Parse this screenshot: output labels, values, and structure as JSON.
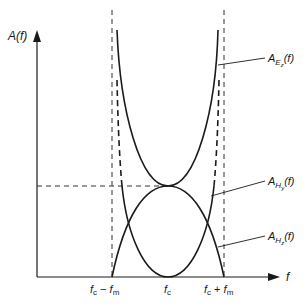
{
  "diagram": {
    "y_axis_label": "A(f)",
    "x_axis_label": "f",
    "x_ticks": [
      "fᴄ − fₘ",
      "fᴄ",
      "fᴄ + fₘ"
    ],
    "x_tick_labels": {
      "left": {
        "base": "f",
        "sub": "c",
        "op": " − ",
        "base2": "f",
        "sub2": "m"
      },
      "center": {
        "base": "f",
        "sub": "c"
      },
      "right": {
        "base": "f",
        "sub": "c",
        "op": " + ",
        "base2": "f",
        "sub2": "m"
      }
    },
    "curves": [
      {
        "name": "A_Ez(f)",
        "label_base": "A",
        "label_sub": "E",
        "label_subsub": "z",
        "label_tail": "(f)",
        "shape": "U-shaped, diverging at f_c ± f_m, minimum at f_c"
      },
      {
        "name": "A_Hy(f)",
        "label_base": "A",
        "label_sub": "H",
        "label_subsub": "y",
        "label_tail": "(f)",
        "shape": "cap-shaped, zero at f_c ± f_m, maximum at f_c"
      },
      {
        "name": "A_Hz(f)",
        "label_base": "A",
        "label_sub": "H",
        "label_subsub": "z",
        "label_tail": "(f)",
        "shape": "U-shaped, zero at f_c, diverging near f_c ± f_m (dashed above crossover)"
      }
    ],
    "colors": {
      "line": "#1a1a1a",
      "dash": "#333333",
      "background": "#ffffff"
    }
  }
}
